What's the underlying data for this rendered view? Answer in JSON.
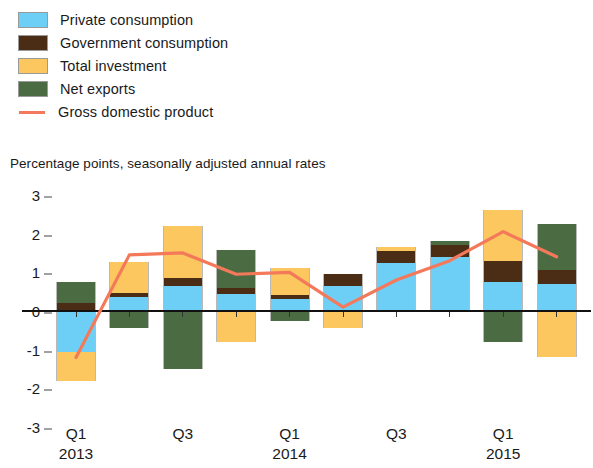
{
  "legend": {
    "items": [
      {
        "label": "Private consumption",
        "type": "swatch",
        "color": "#6DCFF6",
        "icon": "color-swatch"
      },
      {
        "label": "Government consumption",
        "type": "swatch",
        "color": "#4A2D14",
        "icon": "color-swatch"
      },
      {
        "label": "Total investment",
        "type": "swatch",
        "color": "#FBC75E",
        "icon": "color-swatch"
      },
      {
        "label": "Net exports",
        "type": "swatch",
        "color": "#4B6B42",
        "icon": "color-swatch"
      },
      {
        "label": "Gross domestic product",
        "type": "line",
        "color": "#F4795B",
        "icon": "line-swatch"
      }
    ]
  },
  "subtitle": "Percentage points, seasonally adjusted annual rates",
  "chart_data": {
    "type": "bar",
    "title": "",
    "subtitle": "Percentage points, seasonally adjusted annual rates",
    "xlabel": "",
    "ylabel": "Percentage points, seasonally adjusted annual rates",
    "ylim": [
      -3,
      3
    ],
    "yticks": [
      3,
      2,
      1,
      0,
      -1,
      -2,
      -3
    ],
    "ytick_labels": [
      "3",
      "2",
      "1",
      "0",
      "-1",
      "-2",
      "-3"
    ],
    "grid": false,
    "stacked": true,
    "legend_position": "top-left",
    "categories": [
      "Q1 2013",
      "Q2 2013",
      "Q3 2013",
      "Q4 2013",
      "Q1 2014",
      "Q2 2014",
      "Q3 2014",
      "Q4 2014",
      "Q1 2015",
      "Q2 2015"
    ],
    "x_tick_labels": [
      {
        "index": 0,
        "quarter": "Q1",
        "year": "2013"
      },
      {
        "index": 2,
        "quarter": "Q3",
        "year": ""
      },
      {
        "index": 4,
        "quarter": "Q1",
        "year": "2014"
      },
      {
        "index": 6,
        "quarter": "Q3",
        "year": ""
      },
      {
        "index": 8,
        "quarter": "Q1",
        "year": "2015"
      }
    ],
    "series": [
      {
        "name": "Private consumption",
        "color": "#6DCFF6",
        "values": [
          -1.05,
          0.35,
          0.65,
          0.45,
          0.3,
          0.65,
          1.25,
          1.4,
          0.75,
          0.7
        ]
      },
      {
        "name": "Government consumption",
        "color": "#4A2D14",
        "values": [
          0.2,
          0.12,
          0.2,
          0.15,
          0.12,
          0.3,
          0.3,
          0.3,
          0.55,
          0.35
        ]
      },
      {
        "name": "Total investment",
        "color": "#FBC75E",
        "values": [
          -0.75,
          0.8,
          1.35,
          -0.8,
          0.7,
          -0.45,
          0.1,
          0.0,
          1.3,
          -1.2
        ]
      },
      {
        "name": "Net exports",
        "color": "#4B6B42",
        "values": [
          0.55,
          -0.45,
          -1.5,
          0.98,
          -0.25,
          0.0,
          0.0,
          0.1,
          -0.8,
          1.2
        ]
      }
    ],
    "line_series": {
      "name": "Gross domestic product",
      "color": "#F4795B",
      "values": [
        -1.2,
        1.45,
        1.5,
        0.95,
        1.0,
        0.1,
        0.8,
        1.3,
        2.05,
        1.4
      ]
    }
  }
}
